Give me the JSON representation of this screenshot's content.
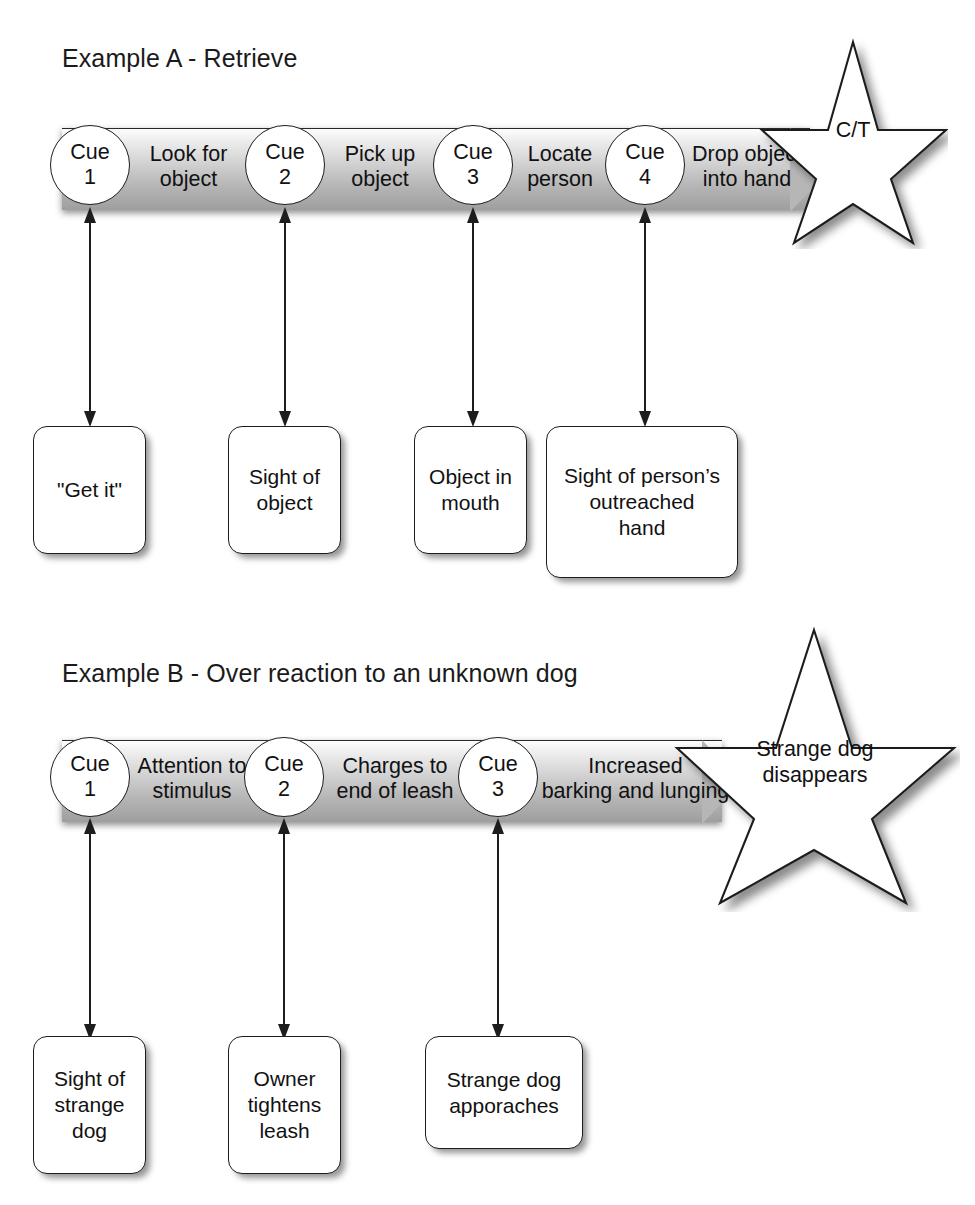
{
  "page": {
    "width": 975,
    "height": 1205,
    "background": "#ffffff",
    "ink": "#111111",
    "bar_light": "#fdfdfd",
    "bar_dark": "#9e9e9e"
  },
  "examples": [
    {
      "id": "example-a",
      "title": "Example A - Retrieve",
      "cues": [
        {
          "label": "Cue",
          "number": "1"
        },
        {
          "label": "Cue",
          "number": "2"
        },
        {
          "label": "Cue",
          "number": "3"
        },
        {
          "label": "Cue",
          "number": "4"
        }
      ],
      "segments": [
        "Look for\nobject",
        "Pick up\nobject",
        "Locate\nperson",
        "Drop object\ninto hand"
      ],
      "terminal_star": "C/T",
      "antecedents": [
        "\"Get it\"",
        "Sight of\nobject",
        "Object in\nmouth",
        "Sight of person’s\noutreached\nhand"
      ]
    },
    {
      "id": "example-b",
      "title": "Example B - Over reaction to an unknown dog",
      "cues": [
        {
          "label": "Cue",
          "number": "1"
        },
        {
          "label": "Cue",
          "number": "2"
        },
        {
          "label": "Cue",
          "number": "3"
        }
      ],
      "segments": [
        "Attention to\nstimulus",
        "Charges to\nend of leash",
        "Increased\nbarking and lunging"
      ],
      "terminal_star": "Strange dog\ndisappears",
      "antecedents": [
        "Sight of\nstrange\ndog",
        "Owner\ntightens\nleash",
        "Strange dog\napporaches"
      ]
    }
  ]
}
